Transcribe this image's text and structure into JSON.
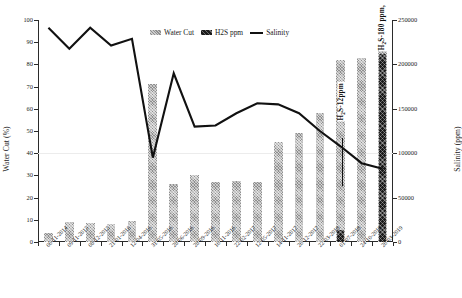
{
  "chart_data": {
    "type": "bar",
    "title": "",
    "xlabel": "",
    "ylabel": "Water Cut (%)",
    "y2label": "Salinity (ppm)",
    "ylim": [
      0,
      100
    ],
    "y2lim": [
      0,
      250000
    ],
    "grid": false,
    "legend_position": "top-center",
    "categories": [
      "06-11-2014",
      "09-11-2015",
      "08-12-2015",
      "21-01-2016",
      "12-04-2016",
      "31-05-2016",
      "28-06-2016",
      "28-09-2016",
      "16-11-2016",
      "22-02-2017",
      "12-05-2017",
      "14-11-2017",
      "26-12-2017",
      "22-03-2018",
      "01-07-2018",
      "24-10-2018",
      "26-03-2019"
    ],
    "yticks": [
      0,
      10,
      20,
      30,
      40,
      50,
      60,
      70,
      80,
      90,
      100
    ],
    "y2ticks": [
      0,
      50000,
      100000,
      150000,
      200000,
      250000
    ],
    "series": [
      {
        "name": "Water Cut",
        "axis": "left",
        "unit": "%",
        "type": "bar",
        "values": [
          4,
          9,
          8.5,
          8,
          9.5,
          71,
          26,
          30,
          27,
          27.5,
          27,
          45,
          49,
          58,
          82,
          83,
          87
        ]
      },
      {
        "name": "H2S ppm",
        "axis": "right",
        "unit": "ppm",
        "type": "bar",
        "values": [
          0,
          0,
          0,
          0,
          0,
          0,
          0,
          0,
          0,
          0,
          0,
          0,
          0,
          0,
          12,
          0,
          180
        ]
      },
      {
        "name": "Salinity",
        "axis": "left-scaled",
        "unit": "ppm",
        "type": "line",
        "values": [
          96.5,
          87,
          96.5,
          88.5,
          91.5,
          38,
          76,
          52,
          52.5,
          58,
          62.5,
          62,
          58,
          50,
          43,
          35.5,
          33
        ]
      }
    ],
    "annotations": [
      {
        "text": "H₂S-12ppm",
        "category": "01-07-2018",
        "value": 12
      },
      {
        "text": "H₂S-180 ppm,",
        "category": "26-03-2019",
        "value": 180
      }
    ]
  },
  "legend": {
    "items": [
      {
        "label": "Water Cut",
        "swatch": "hatched-light-square",
        "color": "#8f8f8f"
      },
      {
        "label": "H2S ppm",
        "swatch": "hatched-dark-square",
        "color": "#1b1b1b"
      },
      {
        "label": "Salinity",
        "swatch": "solid-line",
        "color": "#111111"
      }
    ]
  },
  "axes": {
    "left_title": "Water Cut (%)",
    "right_title": "Salinity (ppm)",
    "left_ticks": [
      "100",
      "90",
      "80",
      "70",
      "60",
      "50",
      "40",
      "30",
      "20",
      "10",
      "0"
    ],
    "right_ticks": [
      "250000",
      "200000",
      "150000",
      "100000",
      "50000",
      "0"
    ]
  },
  "annotation_labels": {
    "h2s_12": "H₂S-12ppm",
    "h2s_180": "H₂S-180 ppm,"
  }
}
